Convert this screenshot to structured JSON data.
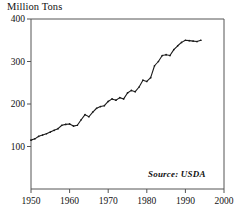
{
  "chart_data": {
    "type": "line",
    "title": "Million Tons",
    "xlabel": "",
    "ylabel": "Million Tons",
    "xlim": [
      1950,
      2000
    ],
    "ylim": [
      0,
      400
    ],
    "grid": false,
    "legend": null,
    "annotation": "Source: USDA",
    "y_ticks": [
      100,
      200,
      300,
      400
    ],
    "x_ticks": [
      1950,
      1960,
      1970,
      1980,
      1990,
      2000
    ],
    "y_tick_labels": [
      "100",
      "200",
      "300",
      "400"
    ],
    "x_tick_labels": [
      "1950",
      "1960",
      "1970",
      "1980",
      "1990",
      "2000"
    ],
    "series": [
      {
        "name": "Production",
        "x": [
          1950,
          1951,
          1952,
          1953,
          1954,
          1955,
          1956,
          1957,
          1958,
          1959,
          1960,
          1961,
          1962,
          1963,
          1964,
          1965,
          1966,
          1967,
          1968,
          1969,
          1970,
          1971,
          1972,
          1973,
          1974,
          1975,
          1976,
          1977,
          1978,
          1979,
          1980,
          1981,
          1982,
          1983,
          1984,
          1985,
          1986,
          1987,
          1988,
          1989,
          1990,
          1991,
          1992,
          1993,
          1994
        ],
        "values": [
          115,
          118,
          124,
          127,
          130,
          134,
          138,
          142,
          150,
          152,
          153,
          148,
          150,
          163,
          175,
          170,
          181,
          190,
          194,
          196,
          206,
          212,
          209,
          215,
          212,
          226,
          232,
          229,
          240,
          256,
          253,
          262,
          290,
          300,
          314,
          316,
          314,
          328,
          337,
          345,
          350,
          349,
          348,
          347,
          350
        ]
      }
    ]
  },
  "axis": {
    "y_title": "Million Tons"
  },
  "source": {
    "text": "Source: USDA"
  }
}
